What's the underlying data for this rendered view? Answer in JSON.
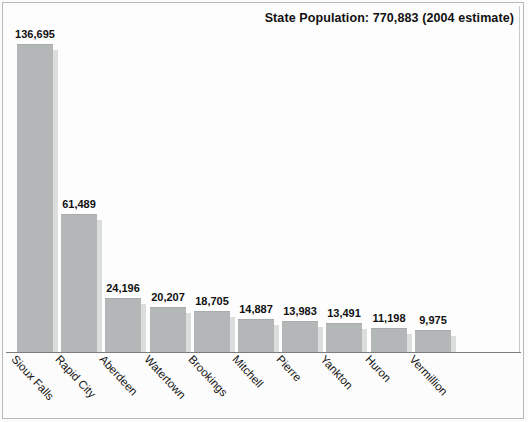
{
  "chart_data": {
    "type": "bar",
    "title": "State Population: 770,883 (2004 estimate)",
    "xlabel": "",
    "ylabel": "",
    "ylim": [
      0,
      145000
    ],
    "grid": false,
    "legend": "none",
    "categories": [
      "Sioux Falls",
      "Rapid City",
      "Aberdeen",
      "Watertown",
      "Brookings",
      "Mitchell",
      "Pierre",
      "Yankton",
      "Huron",
      "Vermillion"
    ],
    "values": [
      136695,
      61489,
      24196,
      20207,
      18705,
      14887,
      13983,
      13491,
      11198,
      9975
    ],
    "value_labels": [
      "136,695",
      "61,489",
      "24,196",
      "20,207",
      "18,705",
      "14,887",
      "13,983",
      "13,491",
      "11,198",
      "9,975"
    ],
    "bar_color": "#b3b7b7",
    "bar_shadow_color": "#dcdedd",
    "background_color": "#fdfdfd",
    "axis_color": "#7d7d7d",
    "text_color": "#111111"
  },
  "figure": {
    "title": "State Population: 770,883 (2004 estimate)"
  }
}
